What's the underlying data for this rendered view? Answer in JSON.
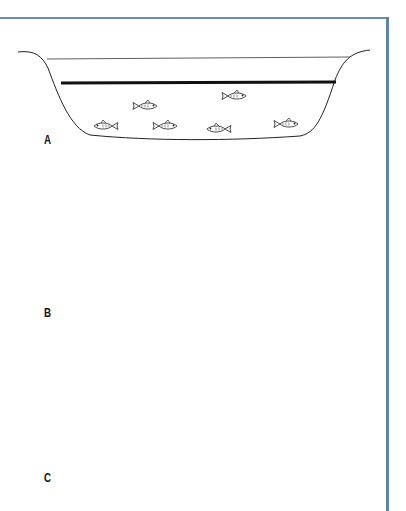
{
  "figure": {
    "border_color": "#5b86a8",
    "panels": [
      {
        "label": "A",
        "thermocline": true,
        "wind_arrow": false,
        "fish_count": 6,
        "fish_location": "below thermocline"
      },
      {
        "label": "B",
        "thermocline": true,
        "wind_arrow": false,
        "fish_count": 9,
        "fish_location": "around thermocline"
      },
      {
        "label": "C",
        "thermocline": false,
        "wind_arrow": true,
        "fish_count": 9,
        "fish_location": "dispersed throughout mixed water"
      }
    ]
  }
}
